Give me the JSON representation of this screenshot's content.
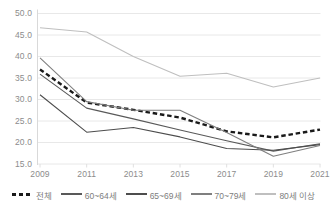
{
  "chart_data": {
    "type": "line",
    "title": "",
    "subtitle": "",
    "xlabel": "",
    "ylabel": "",
    "x": [
      "2009",
      "2011",
      "2013",
      "2015",
      "2017",
      "2019",
      "2021"
    ],
    "categories": [
      "2009",
      "2011",
      "2013",
      "2015",
      "2017",
      "2019",
      "2021"
    ],
    "xtick_labels": [
      "2009",
      "2011",
      "2013",
      "2015",
      "2017",
      "2019",
      "2021"
    ],
    "ytick_labels": [
      "50.0",
      "45.0",
      "40.0",
      "35.0",
      "30.0",
      "25.0",
      "20.0",
      "15.0"
    ],
    "ytick_values": [
      50.0,
      45.0,
      40.0,
      35.0,
      30.0,
      25.0,
      20.0,
      15.0
    ],
    "ylim": [
      15.0,
      50.0
    ],
    "grid": "horizontal",
    "legend_position": "bottom",
    "series": [
      {
        "name": "전체",
        "style": "dashed",
        "color": "#1a1a1a",
        "values": [
          37.0,
          29.3,
          27.6,
          25.8,
          22.6,
          21.2,
          23.0
        ]
      },
      {
        "name": "60~64세",
        "style": "solid",
        "color": "#595959",
        "values": [
          35.9,
          28.0,
          25.5,
          22.9,
          20.4,
          18.0,
          19.7
        ]
      },
      {
        "name": "65~69세",
        "style": "solid",
        "color": "#4d4d4d",
        "values": [
          31.1,
          22.4,
          23.5,
          21.3,
          18.6,
          18.2,
          19.5
        ]
      },
      {
        "name": "70~79세",
        "style": "solid",
        "color": "#7f7f7f",
        "values": [
          39.7,
          29.5,
          27.5,
          27.5,
          22.3,
          16.8,
          19.3
        ]
      },
      {
        "name": "80세 이상",
        "style": "solid",
        "color": "#bfbfbf",
        "values": [
          46.7,
          45.7,
          40.0,
          35.4,
          36.1,
          32.9,
          35.0
        ]
      }
    ]
  },
  "legend": {
    "items": [
      {
        "label": "전체"
      },
      {
        "label": "60~64세"
      },
      {
        "label": "65~69세"
      },
      {
        "label": "70~79세"
      },
      {
        "label": "80세 이상"
      }
    ]
  }
}
